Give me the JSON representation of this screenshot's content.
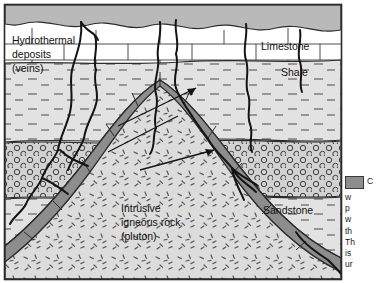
{
  "figure": {
    "type": "geologic-cross-section",
    "frame": {
      "x": 4,
      "y": 4,
      "width": 338,
      "height": 276,
      "border_color": "#2b2b2b"
    }
  },
  "colors": {
    "soil_surface": "#b9b9b9",
    "limestone": "#ffffff",
    "shale": "#e2e2e2",
    "sandstone": "#d2d2d2",
    "pluton": "#dcdcdc",
    "aureole": "#8d8d8d",
    "vein": "#141414",
    "outline": "#2b2b2b",
    "legend_swatch": "#8d8d8d"
  },
  "labels": {
    "hydrothermal": {
      "line1": "Hydrothermal",
      "line2": "deposits",
      "line3": "(veins)",
      "x": 12,
      "y": 44
    },
    "limestone": {
      "text": "Limestone",
      "x": 261,
      "y": 50
    },
    "shale": {
      "text": "Shale",
      "x": 281,
      "y": 76
    },
    "sandstone": {
      "text": "Sandstone",
      "x": 263,
      "y": 214
    },
    "pluton": {
      "line1": "Intrusive",
      "line2": "igneous rock",
      "line3": "(pluton)",
      "x": 121,
      "y": 212
    }
  },
  "units": [
    {
      "name": "soil-surface",
      "pattern": "solid-gray"
    },
    {
      "name": "limestone",
      "pattern": "brick"
    },
    {
      "name": "shale",
      "pattern": "dashes"
    },
    {
      "name": "sandstone",
      "pattern": "circles"
    },
    {
      "name": "intrusive-igneous-rock",
      "pattern": "speckles"
    },
    {
      "name": "contact-metamorphic-aureole",
      "pattern": "solid-gray-blocks"
    }
  ],
  "legend": {
    "swatch_label": "contact-metamorphic-aureole",
    "lines": [
      "C",
      "w",
      "p",
      "w",
      "th",
      "Th",
      "is",
      "ur"
    ]
  }
}
